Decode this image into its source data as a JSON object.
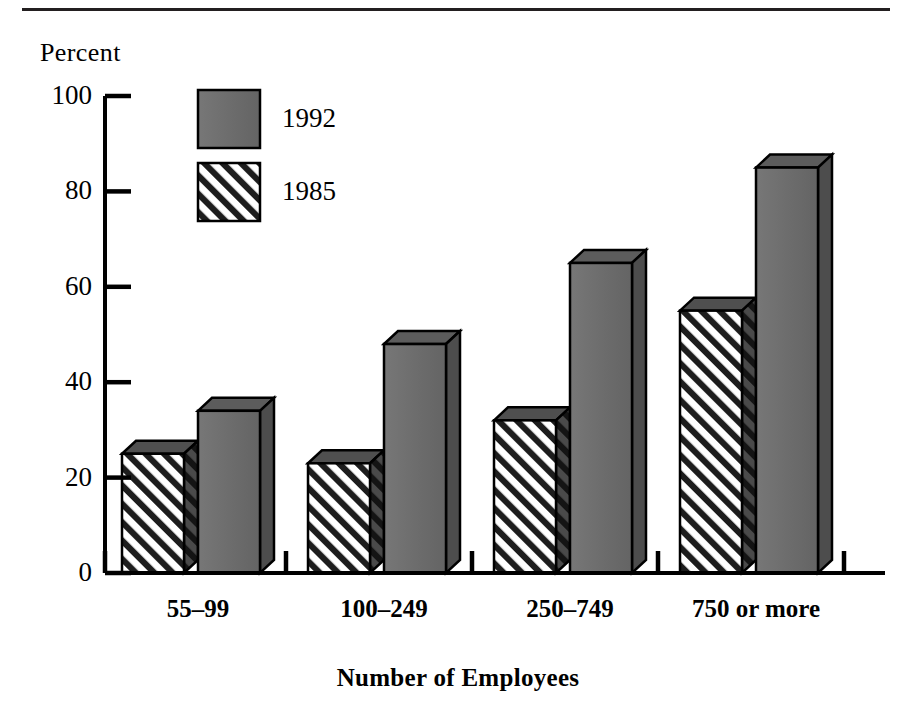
{
  "chart_data": {
    "type": "bar",
    "title": "",
    "subtitle": "",
    "xlabel": "Number of Employees",
    "ylabel": "Percent",
    "categories": [
      "55–99",
      "100–249",
      "250–749",
      "750 or more"
    ],
    "series": [
      {
        "name": "1992",
        "values": [
          34,
          48,
          65,
          85
        ],
        "fill": "#6e6e6e",
        "pattern": "solid"
      },
      {
        "name": "1985",
        "values": [
          25,
          23,
          32,
          55
        ],
        "fill": "#ffffff",
        "pattern": "diagonal-hatch"
      }
    ],
    "series_draw_order": [
      "1985",
      "1992"
    ],
    "ylim": [
      0,
      100
    ],
    "yticks": [
      0,
      20,
      40,
      60,
      80,
      100
    ],
    "ytick_labels": [
      "0",
      "20",
      "40",
      "60",
      "80",
      "100"
    ],
    "grid": false,
    "legend_position": "top-center-inside",
    "style": "3d-bars",
    "bar_colors": {
      "solid_front": "#6e6e6e",
      "solid_side": "#4a4a4a",
      "solid_top": "#5a5a5a",
      "hatch_line": "#1a1a1a",
      "hatch_bg": "#ffffff",
      "outline": "#000000"
    }
  },
  "legend": {
    "entries": [
      {
        "label": "1992",
        "swatch": "solid"
      },
      {
        "label": "1985",
        "swatch": "diagonal-hatch"
      }
    ]
  },
  "axes": {
    "y_title": "Percent",
    "x_title": "Number of Employees"
  },
  "decorations": {
    "top_rule": "horizontal-rule"
  }
}
